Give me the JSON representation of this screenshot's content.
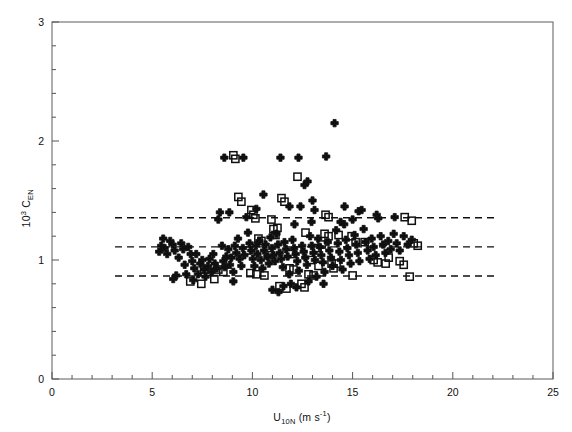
{
  "chart_data": {
    "type": "scatter",
    "title": "",
    "xlabel": "U10N (m s-1)",
    "ylabel": "10^3 CEN",
    "xlim": [
      0,
      25
    ],
    "ylim": [
      0,
      3
    ],
    "xticks": [
      0,
      5,
      10,
      15,
      20,
      25
    ],
    "xtick_labels": [
      "0",
      "5",
      "10",
      "15",
      "20",
      "25"
    ],
    "xminor_step": 1,
    "yticks": [
      0,
      1,
      2,
      3
    ],
    "ytick_labels": [
      "0",
      "1",
      "2",
      "3"
    ],
    "yminor_step": 0.2,
    "grid": false,
    "legend": "none",
    "reference_lines": [
      {
        "name": "upper",
        "y": 1.355,
        "style": "dashed"
      },
      {
        "name": "mean",
        "y": 1.11,
        "style": "dashed"
      },
      {
        "name": "lower",
        "y": 0.865,
        "style": "dashed"
      }
    ],
    "series": [
      {
        "name": "filled-cross",
        "marker": "cross",
        "fill": "#101010",
        "points": [
          [
            5.35,
            1.07
          ],
          [
            5.45,
            1.12
          ],
          [
            5.55,
            1.18
          ],
          [
            5.62,
            1.1
          ],
          [
            5.75,
            1.05
          ],
          [
            5.9,
            1.16
          ],
          [
            6.02,
            1.13
          ],
          [
            6.12,
            1.08
          ],
          [
            6.2,
            0.87
          ],
          [
            6.32,
            1.02
          ],
          [
            6.45,
            1.14
          ],
          [
            6.55,
            1.09
          ],
          [
            6.62,
            0.96
          ],
          [
            6.7,
            0.88
          ],
          [
            6.8,
            1.11
          ],
          [
            6.92,
            1.05
          ],
          [
            7.0,
            0.99
          ],
          [
            7.1,
            0.93
          ],
          [
            7.2,
            1.05
          ],
          [
            7.28,
            0.88
          ],
          [
            7.4,
            0.97
          ],
          [
            7.5,
            1.0
          ],
          [
            7.58,
            0.92
          ],
          [
            7.66,
            0.86
          ],
          [
            7.78,
            0.95
          ],
          [
            7.86,
            1.01
          ],
          [
            7.95,
            0.9
          ],
          [
            8.05,
            1.05
          ],
          [
            8.12,
            0.97
          ],
          [
            8.22,
            0.93
          ],
          [
            8.3,
            1.34
          ],
          [
            8.38,
            1.4
          ],
          [
            8.48,
            1.12
          ],
          [
            8.55,
            0.99
          ],
          [
            8.62,
            0.94
          ],
          [
            8.7,
            1.03
          ],
          [
            8.8,
            1.09
          ],
          [
            8.88,
            0.96
          ],
          [
            8.95,
            1.02
          ],
          [
            9.05,
            0.9
          ],
          [
            9.12,
            1.12
          ],
          [
            9.2,
            1.06
          ],
          [
            9.28,
            1.18
          ],
          [
            9.36,
            1.01
          ],
          [
            9.45,
            0.95
          ],
          [
            9.52,
            1.1
          ],
          [
            9.6,
            1.04
          ],
          [
            9.7,
            1.36
          ],
          [
            9.78,
            1.23
          ],
          [
            9.86,
            1.14
          ],
          [
            9.95,
            1.08
          ],
          [
            10.02,
            1.01
          ],
          [
            10.1,
            0.95
          ],
          [
            10.18,
            1.12
          ],
          [
            10.25,
            1.05
          ],
          [
            10.35,
            1.16
          ],
          [
            10.42,
            1.0
          ],
          [
            10.5,
            0.93
          ],
          [
            10.58,
            1.08
          ],
          [
            10.66,
            1.13
          ],
          [
            10.75,
            1.03
          ],
          [
            10.82,
            0.97
          ],
          [
            10.9,
            1.19
          ],
          [
            10.98,
            1.1
          ],
          [
            11.05,
            1.04
          ],
          [
            11.12,
            0.99
          ],
          [
            11.2,
            1.22
          ],
          [
            11.28,
            1.13
          ],
          [
            11.36,
            1.06
          ],
          [
            11.44,
            1.01
          ],
          [
            11.52,
            0.94
          ],
          [
            11.6,
            1.15
          ],
          [
            11.68,
            1.09
          ],
          [
            11.76,
            1.03
          ],
          [
            11.84,
            0.88
          ],
          [
            11.92,
            0.8
          ],
          [
            12.0,
            1.17
          ],
          [
            12.08,
            1.1
          ],
          [
            12.16,
            1.05
          ],
          [
            12.24,
            0.99
          ],
          [
            12.32,
            0.91
          ],
          [
            12.4,
            1.45
          ],
          [
            12.48,
            1.12
          ],
          [
            12.56,
            1.07
          ],
          [
            12.64,
            1.02
          ],
          [
            12.72,
            0.96
          ],
          [
            12.8,
            0.82
          ],
          [
            12.88,
            1.2
          ],
          [
            12.96,
            1.12
          ],
          [
            13.05,
            1.06
          ],
          [
            13.12,
            1.0
          ],
          [
            13.2,
            0.86
          ],
          [
            13.28,
            1.18
          ],
          [
            13.36,
            1.11
          ],
          [
            13.44,
            1.04
          ],
          [
            13.52,
            0.98
          ],
          [
            13.6,
            0.9
          ],
          [
            13.68,
            1.87
          ],
          [
            13.76,
            1.15
          ],
          [
            13.84,
            1.08
          ],
          [
            13.92,
            1.02
          ],
          [
            14.0,
            0.95
          ],
          [
            14.1,
            2.15
          ],
          [
            14.18,
            1.25
          ],
          [
            14.26,
            1.14
          ],
          [
            14.34,
            1.07
          ],
          [
            14.42,
            1.0
          ],
          [
            14.5,
            0.92
          ],
          [
            14.58,
            1.3
          ],
          [
            14.66,
            1.17
          ],
          [
            14.74,
            1.1
          ],
          [
            14.82,
            1.04
          ],
          [
            14.9,
            0.97
          ],
          [
            15.0,
            1.34
          ],
          [
            15.1,
            1.21
          ],
          [
            15.18,
            1.13
          ],
          [
            15.26,
            1.06
          ],
          [
            15.34,
            0.99
          ],
          [
            15.45,
            1.42
          ],
          [
            15.55,
            1.26
          ],
          [
            15.65,
            1.15
          ],
          [
            15.75,
            1.08
          ],
          [
            15.85,
            1.01
          ],
          [
            15.95,
            1.18
          ],
          [
            16.05,
            1.11
          ],
          [
            16.15,
            1.04
          ],
          [
            16.28,
            1.35
          ],
          [
            16.4,
            1.2
          ],
          [
            16.52,
            1.13
          ],
          [
            16.64,
            1.06
          ],
          [
            16.78,
            1.16
          ],
          [
            16.9,
            1.09
          ],
          [
            17.05,
            1.22
          ],
          [
            17.2,
            1.14
          ],
          [
            17.35,
            1.08
          ],
          [
            17.55,
            1.2
          ],
          [
            17.75,
            1.13
          ],
          [
            17.95,
            1.17
          ],
          [
            8.6,
            1.86
          ],
          [
            9.55,
            1.86
          ],
          [
            11.4,
            1.86
          ],
          [
            12.3,
            1.86
          ],
          [
            12.6,
            1.63
          ],
          [
            12.75,
            1.66
          ],
          [
            10.55,
            1.55
          ],
          [
            11.85,
            1.45
          ],
          [
            13.1,
            1.42
          ],
          [
            14.6,
            1.45
          ],
          [
            15.3,
            1.41
          ],
          [
            13.0,
            1.5
          ],
          [
            10.2,
            1.43
          ],
          [
            8.85,
            1.4
          ],
          [
            17.1,
            1.36
          ],
          [
            16.2,
            1.38
          ],
          [
            12.1,
            1.3
          ],
          [
            12.95,
            1.32
          ],
          [
            14.4,
            1.32
          ],
          [
            6.05,
            0.84
          ],
          [
            7.05,
            0.83
          ],
          [
            9.05,
            0.82
          ],
          [
            11.55,
            0.78
          ],
          [
            12.2,
            0.77
          ],
          [
            13.55,
            0.8
          ],
          [
            11.0,
            0.75
          ],
          [
            11.3,
            0.73
          ]
        ]
      },
      {
        "name": "open-square",
        "marker": "square-open",
        "fill": "none",
        "points": [
          [
            9.05,
            1.88
          ],
          [
            9.15,
            1.85
          ],
          [
            12.25,
            1.7
          ],
          [
            9.3,
            1.53
          ],
          [
            9.45,
            1.49
          ],
          [
            11.45,
            1.52
          ],
          [
            11.6,
            1.49
          ],
          [
            10.05,
            1.38
          ],
          [
            10.15,
            1.35
          ],
          [
            13.65,
            1.38
          ],
          [
            13.8,
            1.36
          ],
          [
            17.6,
            1.36
          ],
          [
            17.95,
            1.33
          ],
          [
            11.05,
            1.26
          ],
          [
            11.25,
            1.27
          ],
          [
            11.15,
            1.21
          ],
          [
            12.65,
            1.23
          ],
          [
            13.6,
            1.22
          ],
          [
            13.8,
            1.2
          ],
          [
            14.3,
            1.21
          ],
          [
            10.3,
            1.18
          ],
          [
            10.45,
            1.16
          ],
          [
            14.95,
            1.2
          ],
          [
            15.15,
            1.15
          ],
          [
            18.05,
            1.14
          ],
          [
            18.25,
            1.12
          ],
          [
            13.45,
            1.13
          ],
          [
            13.25,
            1.1
          ],
          [
            7.6,
            0.92
          ],
          [
            7.85,
            0.9
          ],
          [
            8.3,
            0.92
          ],
          [
            8.55,
            0.9
          ],
          [
            9.9,
            0.89
          ],
          [
            10.2,
            0.88
          ],
          [
            10.6,
            0.87
          ],
          [
            11.85,
            0.93
          ],
          [
            12.05,
            0.92
          ],
          [
            12.8,
            0.88
          ],
          [
            13.05,
            0.87
          ],
          [
            13.95,
            0.97
          ],
          [
            14.05,
            0.93
          ],
          [
            14.2,
            0.97
          ],
          [
            16.05,
            1.0
          ],
          [
            16.25,
            0.98
          ],
          [
            16.65,
            0.97
          ],
          [
            16.8,
            1.02
          ],
          [
            17.35,
            0.99
          ],
          [
            17.55,
            0.96
          ],
          [
            17.85,
            0.86
          ],
          [
            6.9,
            0.82
          ],
          [
            7.45,
            0.8
          ],
          [
            8.1,
            0.84
          ],
          [
            11.35,
            0.78
          ],
          [
            11.7,
            0.76
          ],
          [
            12.45,
            0.8
          ],
          [
            12.6,
            0.77
          ],
          [
            15.0,
            0.87
          ],
          [
            9.95,
            1.42
          ],
          [
            10.95,
            1.34
          ],
          [
            15.6,
            1.15
          ],
          [
            11.9,
            1.05
          ],
          [
            12.9,
            1.0
          ],
          [
            10.8,
            1.04
          ],
          [
            13.3,
            0.95
          ],
          [
            9.7,
            1.08
          ]
        ]
      }
    ]
  },
  "axes": {
    "x_axis_name": "u10n-axis",
    "y_axis_name": "cen-axis"
  }
}
